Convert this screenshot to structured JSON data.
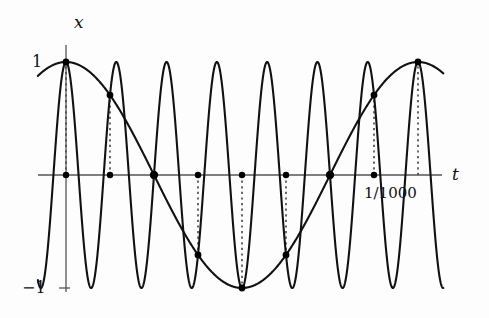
{
  "figure": {
    "title_visible": false,
    "background_color": "#fdfdfd",
    "curve_color": "#111111",
    "axis_color": "#555555",
    "sample_dot_color": "#000000",
    "dotted_line_color": "#444444"
  },
  "labels": {
    "y_axis": "x",
    "x_axis": "t",
    "y_tick_top": "1",
    "y_tick_bottom": "−1",
    "x_tick_period": "1/1000"
  },
  "chart_data": {
    "type": "line",
    "title": "",
    "xlabel": "t",
    "ylabel": "x",
    "grid": false,
    "legend": null,
    "xlim": [
      -8e-05,
      0.001072
    ],
    "ylim": [
      -1.35,
      1.35
    ],
    "y_ticks": [
      {
        "value": 1,
        "label": "1"
      },
      {
        "value": -1,
        "label": "−1"
      }
    ],
    "x_ticks": [
      {
        "value": 0.001,
        "label": "1/1000"
      }
    ],
    "series": [
      {
        "name": "high-frequency cosine",
        "kind": "cosine",
        "amplitude": 1,
        "frequency_hz": 7000,
        "phase_deg": 0,
        "period": 0.00014286,
        "peaks_t": [
          0,
          0.00014286,
          0.00028571,
          0.00042857,
          0.00057143,
          0.00071429,
          0.00085714,
          0.001
        ],
        "troughs_t": [
          7.143e-05,
          0.00021429,
          0.00035714,
          0.0005,
          0.00064286,
          0.00078571,
          0.00092857
        ]
      },
      {
        "name": "aliased low-frequency cosine",
        "kind": "cosine",
        "amplitude": 1,
        "frequency_hz": 1000,
        "phase_deg": 0,
        "period": 0.001,
        "peaks_t": [
          0,
          0.001
        ],
        "troughs_t": [
          0.0005
        ]
      }
    ],
    "samples": {
      "name": "sample points",
      "interval": 0.000125,
      "count": 9,
      "t": [
        0,
        0.000125,
        0.00025,
        0.000375,
        0.0005,
        0.000625,
        0.00075,
        0.000875,
        0.001
      ],
      "x": [
        1,
        0.7071,
        0,
        -0.7071,
        -1,
        -0.7071,
        0,
        0.7071,
        1
      ]
    },
    "axis_dots_t": [
      0,
      0.000125,
      0.00025,
      0.000375,
      0.0005,
      0.000625,
      0.00075,
      0.000875
    ]
  }
}
